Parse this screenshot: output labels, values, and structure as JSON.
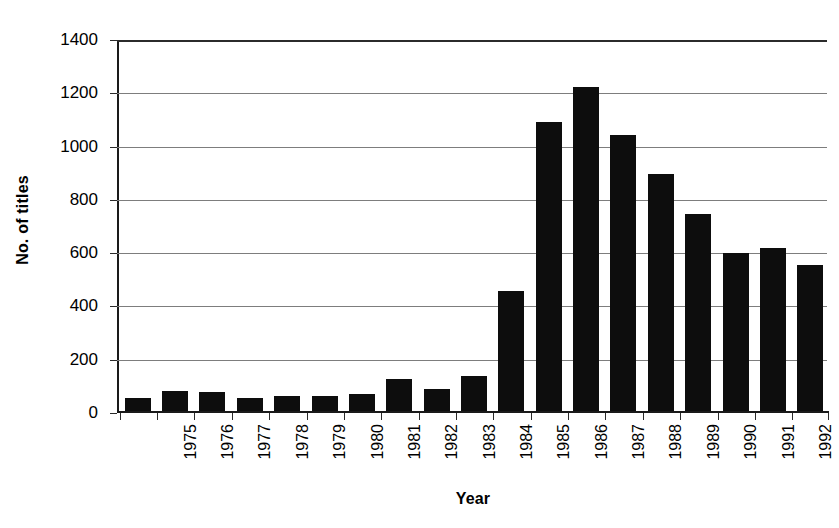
{
  "chart_data": {
    "type": "bar",
    "title": "",
    "xlabel": "Year",
    "ylabel": "No. of titles",
    "categories": [
      "1975",
      "1976",
      "1977",
      "1978",
      "1979",
      "1980",
      "1981",
      "1982",
      "1983",
      "1984",
      "1985",
      "1986",
      "1987",
      "1988",
      "1989",
      "1990",
      "1991",
      "1992",
      "1993"
    ],
    "values": [
      50,
      75,
      72,
      48,
      58,
      58,
      65,
      120,
      82,
      132,
      450,
      1085,
      1218,
      1035,
      888,
      738,
      592,
      610,
      548
    ],
    "ylim": [
      0,
      1400
    ],
    "ytick_labels": [
      "0",
      "200",
      "400",
      "600",
      "800",
      "1000",
      "1200",
      "1400"
    ],
    "ytick_values": [
      0,
      200,
      400,
      600,
      800,
      1000,
      1200,
      1400
    ],
    "grid": "horizontal",
    "legend": "none",
    "bar_color": "#0d0d0d",
    "grid_color": "#7d7d7d",
    "axis_color": "#1a1a1a"
  }
}
